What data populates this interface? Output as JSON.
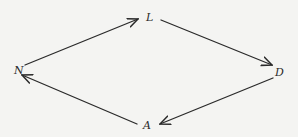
{
  "diagram": {
    "background": "#f4f4f2",
    "stroke_color": "#2a2a2a",
    "nodes": [
      {
        "id": "N",
        "label": "N",
        "x": 18,
        "y": 70
      },
      {
        "id": "L",
        "label": "L",
        "x": 149,
        "y": 18
      },
      {
        "id": "D",
        "label": "D",
        "x": 279,
        "y": 72
      },
      {
        "id": "A",
        "label": "A",
        "x": 147,
        "y": 125
      }
    ],
    "edges": [
      {
        "from": "N",
        "to": "L"
      },
      {
        "from": "L",
        "to": "D"
      },
      {
        "from": "D",
        "to": "A"
      },
      {
        "from": "A",
        "to": "N"
      }
    ]
  }
}
